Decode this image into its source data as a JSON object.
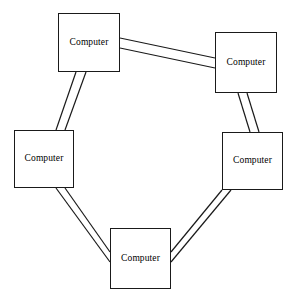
{
  "diagram": {
    "type": "ring-network-topology",
    "canvas": {
      "width": 294,
      "height": 296
    },
    "background_color": "#ffffff",
    "line_color": "#1a1a1a",
    "node_fill_color": "#ffffff",
    "node_label_color": "#000000",
    "nodes": [
      {
        "id": "node-top-left",
        "label": "Computer",
        "x": 58,
        "y": 13,
        "width": 62,
        "height": 59
      },
      {
        "id": "node-top-right",
        "label": "Computer",
        "x": 215,
        "y": 32,
        "width": 62,
        "height": 61
      },
      {
        "id": "node-left",
        "label": "Computer",
        "x": 14,
        "y": 130,
        "width": 60,
        "height": 58
      },
      {
        "id": "node-right",
        "label": "Computer",
        "x": 222,
        "y": 132,
        "width": 61,
        "height": 58
      },
      {
        "id": "node-bottom",
        "label": "Computer",
        "x": 110,
        "y": 228,
        "width": 61,
        "height": 61
      }
    ],
    "links": [
      {
        "id": "link-top-left-to-top-right",
        "from": "node-top-left",
        "to": "node-top-right",
        "style": "double-line",
        "a": {
          "x1": 120,
          "y1": 38,
          "x2": 215,
          "y2": 58
        },
        "b": {
          "x1": 120,
          "y1": 48,
          "x2": 215,
          "y2": 68
        }
      },
      {
        "id": "link-top-right-to-right",
        "from": "node-top-right",
        "to": "node-right",
        "style": "double-line",
        "a": {
          "x1": 238,
          "y1": 93,
          "x2": 250,
          "y2": 132
        },
        "b": {
          "x1": 247,
          "y1": 93,
          "x2": 259,
          "y2": 132
        }
      },
      {
        "id": "link-right-to-bottom",
        "from": "node-right",
        "to": "node-bottom",
        "style": "double-line",
        "a": {
          "x1": 222,
          "y1": 190,
          "x2": 171,
          "y2": 252
        },
        "b": {
          "x1": 231,
          "y1": 190,
          "x2": 171,
          "y2": 262
        }
      },
      {
        "id": "link-bottom-to-left",
        "from": "node-bottom",
        "to": "node-left",
        "style": "double-line",
        "a": {
          "x1": 110,
          "y1": 252,
          "x2": 65,
          "y2": 188
        },
        "b": {
          "x1": 110,
          "y1": 262,
          "x2": 56,
          "y2": 188
        }
      },
      {
        "id": "link-left-to-top-left",
        "from": "node-left",
        "to": "node-top-left",
        "style": "double-line",
        "a": {
          "x1": 56,
          "y1": 130,
          "x2": 76,
          "y2": 72
        },
        "b": {
          "x1": 65,
          "y1": 130,
          "x2": 86,
          "y2": 72
        }
      }
    ]
  }
}
